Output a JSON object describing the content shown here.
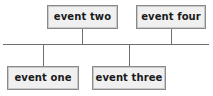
{
  "diagram": {
    "type": "bus-tree",
    "canvas": {
      "width": 213,
      "height": 96
    },
    "colors": {
      "background": "#ffffff",
      "box_fill": "#f0f0f0",
      "box_border": "#8a8a8a",
      "box_inner_border": "#c9c9c9",
      "line": "#6f6f6f",
      "text": "#1a1a1a"
    },
    "bus": {
      "orientation": "horizontal",
      "y": 44,
      "x_start": 3,
      "x_end": 209,
      "thickness": 1
    },
    "nodes": [
      {
        "id": "event-two",
        "label": "event two",
        "side": "above",
        "x": 47,
        "y": 5,
        "width": 71,
        "height": 24,
        "connector_x": 82,
        "connector_from": 29,
        "connector_to": 44
      },
      {
        "id": "event-four",
        "label": "event four",
        "side": "above",
        "x": 136,
        "y": 5,
        "width": 70,
        "height": 24,
        "connector_x": 171,
        "connector_from": 29,
        "connector_to": 44
      },
      {
        "id": "event-one",
        "label": "event one",
        "side": "below",
        "x": 7,
        "y": 66,
        "width": 72,
        "height": 24,
        "connector_x": 43,
        "connector_from": 44,
        "connector_to": 66
      },
      {
        "id": "event-three",
        "label": "event three",
        "side": "below",
        "x": 92,
        "y": 66,
        "width": 74,
        "height": 24,
        "connector_x": 129,
        "connector_from": 44,
        "connector_to": 66
      }
    ]
  }
}
